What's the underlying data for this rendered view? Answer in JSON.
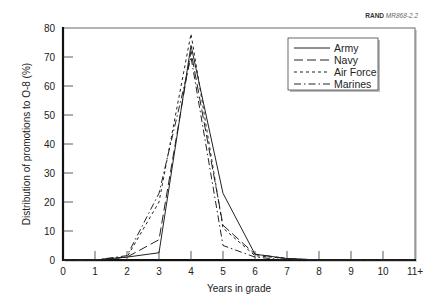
{
  "source_note": {
    "org": "RAND",
    "id": "MR868-2.2"
  },
  "chart_data": {
    "type": "line",
    "title": "",
    "xlabel": "Years in grade",
    "ylabel": "Distribution of promotions to O-8 (%)",
    "x": [
      "0",
      "1",
      "2",
      "3",
      "4",
      "5",
      "6",
      "7",
      "8",
      "9",
      "10",
      "11+"
    ],
    "ylim": [
      0,
      80
    ],
    "yticks": [
      0,
      10,
      20,
      30,
      40,
      50,
      60,
      70,
      80
    ],
    "grid": false,
    "legend_position": "upper right",
    "series": [
      {
        "name": "Army",
        "style": "solid",
        "values": [
          0,
          0,
          1,
          2.5,
          74,
          23,
          2,
          0.5,
          0,
          0,
          0,
          0
        ]
      },
      {
        "name": "Navy",
        "style": "longdash",
        "values": [
          0,
          0,
          1,
          7,
          72,
          12,
          2,
          0.5,
          0,
          0,
          0,
          0
        ]
      },
      {
        "name": "Air Force",
        "style": "shortdash",
        "values": [
          0,
          0,
          1,
          20,
          78,
          11,
          1.5,
          0.5,
          0,
          0,
          0,
          0
        ]
      },
      {
        "name": "Marines",
        "style": "dashdot",
        "values": [
          0,
          0,
          1.5,
          23,
          70,
          5,
          1,
          0,
          0,
          0,
          0,
          0
        ]
      }
    ]
  }
}
